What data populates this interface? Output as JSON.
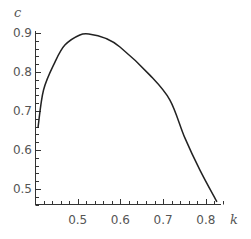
{
  "chart_data": {
    "type": "line",
    "title": "",
    "xlabel": "k",
    "ylabel": "c",
    "xlim": [
      0.4,
      0.837
    ],
    "ylim": [
      0.445,
      0.9
    ],
    "grid": false,
    "legend": null,
    "x_ticks": [
      0.5,
      0.6,
      0.7,
      0.8
    ],
    "y_ticks": [
      0.5,
      0.6,
      0.7,
      0.8,
      0.9
    ],
    "x_tick_labels": [
      "0.5",
      "0.6",
      "0.7",
      "0.8"
    ],
    "y_tick_labels": [
      "0.5",
      "0.6",
      "0.7",
      "0.8",
      "0.9"
    ],
    "series": [
      {
        "name": "c(k)",
        "color": "#222222",
        "x": [
          0.407,
          0.42,
          0.447,
          0.47,
          0.505,
          0.529,
          0.564,
          0.599,
          0.669,
          0.716,
          0.751,
          0.786,
          0.826
        ],
        "y": [
          0.657,
          0.754,
          0.826,
          0.869,
          0.895,
          0.897,
          0.887,
          0.864,
          0.792,
          0.728,
          0.631,
          0.549,
          0.467
        ]
      }
    ]
  },
  "axes": {
    "x_label": "k",
    "y_label": "c",
    "axis_color": "#333333"
  }
}
